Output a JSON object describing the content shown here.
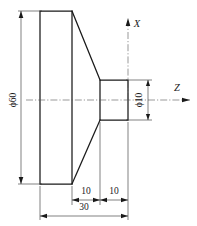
{
  "drawing": {
    "title": "Turned flanged shaft - section view",
    "description": "Mechanical part drawing with flange, tapered cone and small cylinder",
    "line_color": "#1a1a1a",
    "thin_line_color": "#2b2b2b",
    "center_line_color": "#555555",
    "background_color": "#ffffff"
  },
  "dimensions": {
    "flange_diameter": "ϕ60",
    "shaft_diameter": "ϕ10",
    "cone_length": "10",
    "cylinder_length": "10",
    "total_length": "30"
  },
  "axes": {
    "x_label": "X",
    "z_label": "Z"
  }
}
